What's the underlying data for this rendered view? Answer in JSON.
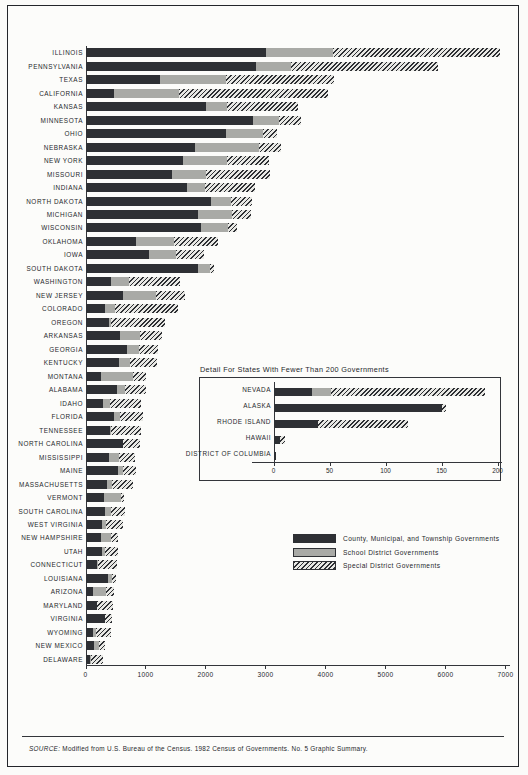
{
  "legend": {
    "items": [
      {
        "key": "cmt",
        "label": "County, Municipal, and Township Governments",
        "color": "#2e3034"
      },
      {
        "key": "sch",
        "label": "School District Governments",
        "color": "#a9aaa6"
      },
      {
        "key": "spd",
        "label": "Special District Governments",
        "color": "#2e3034"
      }
    ]
  },
  "inset": {
    "title": "Detail For States With Fewer Than 200 Governments"
  },
  "footer": {
    "source_prefix": "SOURCE:",
    "source_text": " Modified from U.S. Bureau of the Census.  1982 Census of Governments. No. 5 Graphic Summary."
  },
  "chart_data": [
    {
      "id": "main",
      "type": "bar",
      "orientation": "horizontal",
      "stacked": true,
      "title": "",
      "xlabel": "",
      "ylabel": "",
      "xlim": [
        0,
        7000
      ],
      "xticks": [
        0,
        1000,
        2000,
        3000,
        4000,
        5000,
        6000,
        7000
      ],
      "xticklabels": [
        "0",
        "1000",
        "2000",
        "3000",
        "4000",
        "5000",
        "6000",
        "7000"
      ],
      "grid": false,
      "legend_position": "inside-lower-right",
      "series": [
        {
          "name": "County, Municipal, and Township Governments",
          "key": "cmt"
        },
        {
          "name": "School District Governments",
          "key": "sch"
        },
        {
          "name": "Special District Governments",
          "key": "spd"
        }
      ],
      "categories": [
        "ILLINOIS",
        "PENNSYLVANIA",
        "TEXAS",
        "CALIFORNIA",
        "KANSAS",
        "MINNESOTA",
        "OHIO",
        "NEBRASKA",
        "NEW YORK",
        "MISSOURI",
        "INDIANA",
        "NORTH DAKOTA",
        "MICHIGAN",
        "WISCONSIN",
        "OKLAHOMA",
        "IOWA",
        "SOUTH DAKOTA",
        "WASHINGTON",
        "NEW JERSEY",
        "COLORADO",
        "OREGON",
        "ARKANSAS",
        "GEORGIA",
        "KENTUCKY",
        "MONTANA",
        "ALABAMA",
        "IDAHO",
        "FLORIDA",
        "TENNESSEE",
        "NORTH CAROLINA",
        "MISSISSIPPI",
        "MAINE",
        "MASSACHUSETTS",
        "VERMONT",
        "SOUTH CAROLINA",
        "WEST VIRGINIA",
        "NEW HAMPSHIRE",
        "UTAH",
        "CONNECTICUT",
        "LOUISIANA",
        "ARIZONA",
        "MARYLAND",
        "VIRGINIA",
        "WYOMING",
        "NEW MEXICO",
        "DELAWARE"
      ],
      "values": {
        "cmt": [
          3000,
          2840,
          1230,
          460,
          2000,
          2780,
          2330,
          1810,
          1610,
          1430,
          1680,
          2090,
          1860,
          1920,
          830,
          1050,
          1870,
          410,
          610,
          310,
          380,
          570,
          690,
          550,
          250,
          520,
          280,
          470,
          400,
          620,
          380,
          530,
          350,
          300,
          310,
          270,
          250,
          270,
          180,
          370,
          110,
          180,
          320,
          120,
          130,
          60
        ],
        "sch": [
          1110,
          570,
          1110,
          1090,
          350,
          440,
          620,
          1070,
          740,
          570,
          300,
          320,
          580,
          440,
          640,
          450,
          190,
          300,
          550,
          180,
          40,
          330,
          190,
          180,
          530,
          130,
          120,
          100,
          20,
          0,
          170,
          90,
          90,
          280,
          100,
          60,
          170,
          40,
          20,
          70,
          230,
          0,
          0,
          50,
          90,
          20
        ],
        "spd": [
          2790,
          2460,
          1790,
          2490,
          1180,
          360,
          230,
          370,
          700,
          1070,
          830,
          350,
          310,
          160,
          730,
          470,
          70,
          860,
          490,
          1050,
          890,
          360,
          320,
          460,
          220,
          350,
          510,
          380,
          500,
          280,
          260,
          210,
          350,
          60,
          240,
          280,
          120,
          230,
          310,
          60,
          130,
          270,
          120,
          240,
          90,
          210
        ]
      }
    },
    {
      "id": "inset",
      "type": "bar",
      "orientation": "horizontal",
      "stacked": true,
      "title": "Detail For States With Fewer Than 200 Governments",
      "xlabel": "",
      "ylabel": "",
      "xlim": [
        0,
        200
      ],
      "xticks": [
        0,
        50,
        100,
        150,
        200
      ],
      "xticklabels": [
        "0",
        "50",
        "100",
        "150",
        "200"
      ],
      "grid": false,
      "series": [
        {
          "name": "County, Municipal, and Township Governments",
          "key": "cmt"
        },
        {
          "name": "School District Governments",
          "key": "sch"
        },
        {
          "name": "Special District Governments",
          "key": "spd"
        }
      ],
      "categories": [
        "NEVADA",
        "ALASKA",
        "RHODE ISLAND",
        "HAWAII",
        "DISTRICT OF COLUMBIA"
      ],
      "values": {
        "cmt": [
          34,
          150,
          39,
          5,
          2
        ],
        "sch": [
          17,
          0,
          0,
          0,
          0
        ],
        "spd": [
          137,
          4,
          81,
          5,
          0
        ]
      }
    }
  ]
}
